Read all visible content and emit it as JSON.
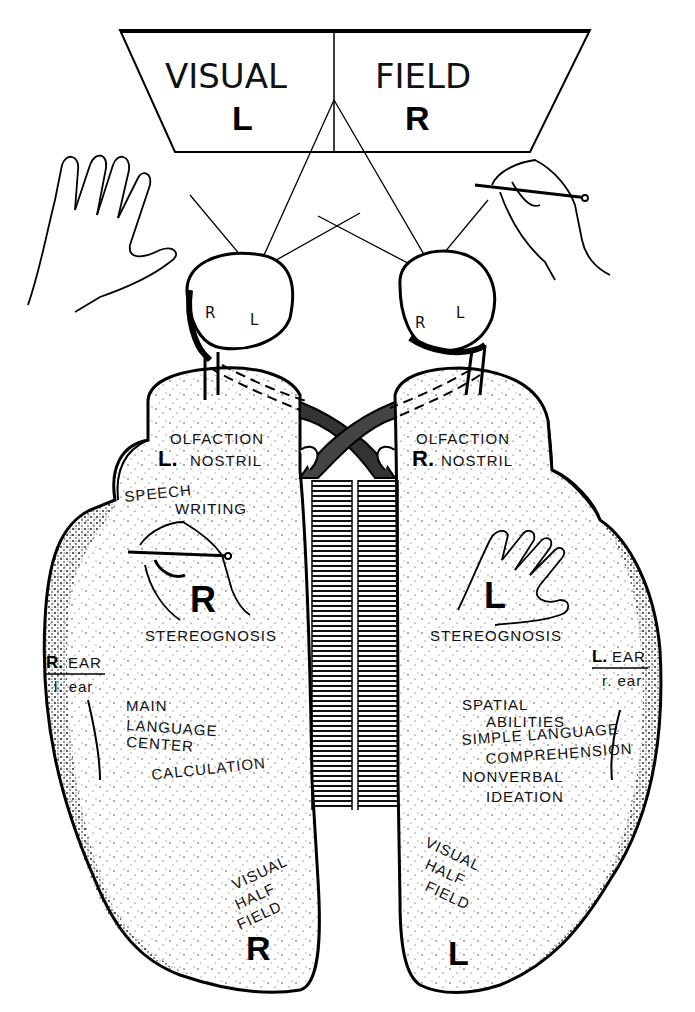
{
  "diagram": {
    "visual_field": {
      "title_left": "VISUAL",
      "title_right": "FIELD",
      "left_letter": "L",
      "right_letter": "R"
    },
    "eyes": {
      "left_eye": {
        "r": "R",
        "l": "L"
      },
      "right_eye": {
        "r": "R",
        "l": "L"
      }
    },
    "left_hemisphere": {
      "olfaction": "OLFACTION",
      "nostril_letter": "L.",
      "nostril": "NOSTRIL",
      "speech": "SPEECH",
      "writing": "WRITING",
      "hand_letter": "R",
      "stereognosis": "STEREOGNOSIS",
      "ear_major_letter": "R.",
      "ear_major": "EAR",
      "ear_minor": "l. ear",
      "main": "MAIN",
      "language": "LANGUAGE",
      "center": "CENTER",
      "calculation": "CALCULATION",
      "visual": "VISUAL",
      "half": "HALF",
      "field": "FIELD",
      "field_letter": "R"
    },
    "right_hemisphere": {
      "olfaction": "OLFACTION",
      "nostril_letter": "R.",
      "nostril": "NOSTRIL",
      "hand_letter": "L",
      "stereognosis": "STEREOGNOSIS",
      "ear_major_letter": "L.",
      "ear_major": "EAR",
      "ear_minor": "r. ear",
      "spatial": "SPATIAL",
      "abilities": "ABILITIES",
      "simple_language": "SIMPLE LANGUAGE",
      "comprehension": "COMPREHENSION",
      "nonverbal": "NONVERBAL",
      "ideation": "IDEATION",
      "visual": "VISUAL",
      "half": "HALF",
      "field": "FIELD",
      "field_letter": "L"
    }
  }
}
